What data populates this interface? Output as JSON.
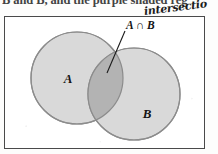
{
  "page": {
    "width": 218,
    "height": 154,
    "background_color": "#fdfdfc"
  },
  "caption": {
    "printed_text_cutoff": "B and B, and the purple shaded reg",
    "note": "bottom sliver of a printed sentence, top of letters cropped off"
  },
  "annotation": {
    "handwritten_text": "intersectio",
    "full_word_implied": "intersection",
    "ink_color": "#1c1c1c"
  },
  "diagram": {
    "type": "venn-diagram",
    "universe_box": {
      "stroke_color": "#4a4a4a",
      "fill_color": "#ffffff"
    },
    "sets": [
      {
        "label": "A",
        "fill_color": "#d9d9d9",
        "stroke_color": "#8c8c8c",
        "cx": 73,
        "cy": 62,
        "r": 46
      },
      {
        "label": "B",
        "fill_color": "#d9d9d9",
        "stroke_color": "#8c8c8c",
        "cx": 130,
        "cy": 78,
        "r": 46
      }
    ],
    "intersection": {
      "label": "A ∩ B",
      "fill_color": "#b3b3b3",
      "leader_line_color": "#1a1a1a"
    }
  }
}
